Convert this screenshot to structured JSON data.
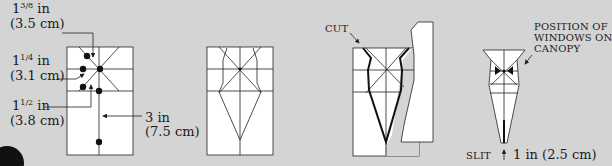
{
  "step1": {
    "label_a": {
      "whole": "1",
      "num": "3",
      "den": "8",
      "unit": " in",
      "metric": "(3.5 cm)"
    },
    "label_b": {
      "whole": "1",
      "num": "1",
      "den": "4",
      "unit": " in",
      "metric": "(3.1 cm)"
    },
    "label_c": {
      "whole": "1",
      "num": "1",
      "den": "2",
      "unit": " in",
      "metric": "(3.8 cm)"
    },
    "label_d": {
      "text": "3 in",
      "metric": "(7.5 cm)"
    }
  },
  "step3": {
    "cut_label": "CUT"
  },
  "step4": {
    "windows_label_1": "POSITION OF",
    "windows_label_2": "WINDOWS ON",
    "windows_label_3": "CANOPY",
    "slit_label": "SLIT",
    "slit_measure": "1 in (2.5 cm)"
  },
  "colors": {
    "background": "#d4d4d4",
    "paper": "#ffffff",
    "line": "#222222"
  }
}
